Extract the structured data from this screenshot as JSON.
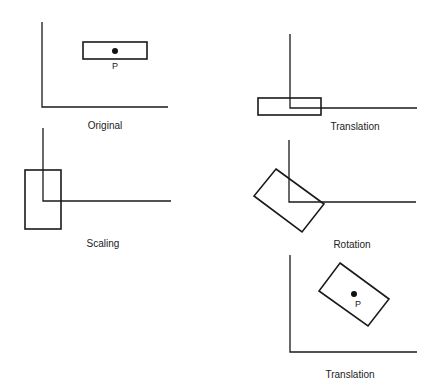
{
  "panels": [
    {
      "id": "original",
      "caption": "Original",
      "has_point": true,
      "point_label": "P"
    },
    {
      "id": "translation-1",
      "caption": "Translation",
      "has_point": false,
      "point_label": ""
    },
    {
      "id": "scaling",
      "caption": "Scaling",
      "has_point": false,
      "point_label": ""
    },
    {
      "id": "rotation",
      "caption": "Rotation",
      "has_point": false,
      "point_label": ""
    },
    {
      "id": "translation-2",
      "caption": "Translation",
      "has_point": true,
      "point_label": "P"
    }
  ],
  "colors": {
    "ink": "#1a1a1a",
    "background": "#ffffff"
  }
}
